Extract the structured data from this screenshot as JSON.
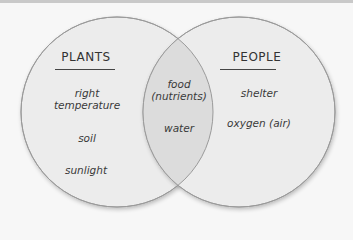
{
  "diagram": {
    "type": "venn",
    "left_set": {
      "title": "PLANTS",
      "items": [
        "right temperature",
        "soil",
        "sunlight"
      ]
    },
    "right_set": {
      "title": "PEOPLE",
      "items": [
        "shelter",
        "oxygen (air)"
      ]
    },
    "intersection": {
      "items": [
        "food (nutrients)",
        "water"
      ]
    },
    "colors": {
      "background": "#f7f7f7",
      "circle_fill": "#ececec",
      "intersection_fill": "#dddddd",
      "stroke": "#9a9a9a",
      "text": "#3a3a3a"
    }
  },
  "labels": {
    "plants": "PLANTS",
    "people": "PEOPLE",
    "right_line1": "right",
    "right_line2": "temperature",
    "soil": "soil",
    "sunlight": "sunlight",
    "food_line1": "food",
    "food_line2": "(nutrients)",
    "water": "water",
    "shelter": "shelter",
    "oxygen": "oxygen (air)"
  }
}
